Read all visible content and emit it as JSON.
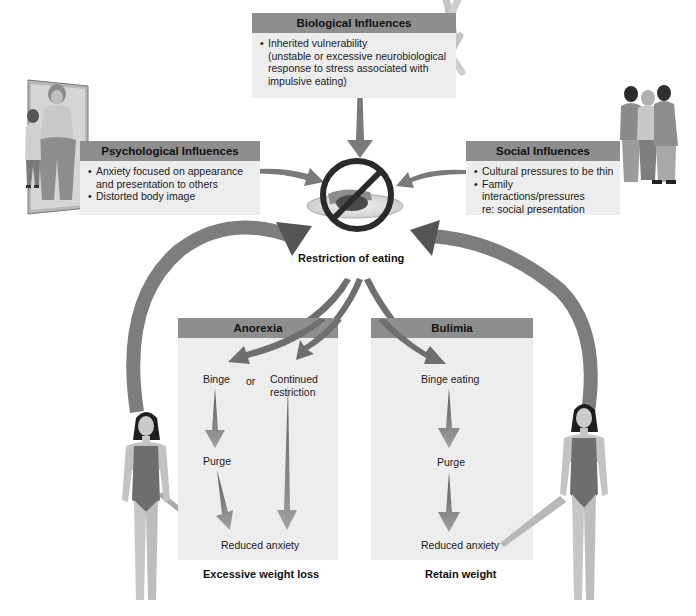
{
  "biological": {
    "title": "Biological Influences",
    "items": [
      "Inherited vulnerability (unstable or excessive neurobiological response to stress associated with impulsive eating)"
    ],
    "item_lines": [
      "Inherited vulnerability",
      "(unstable or excessive neurobiological",
      "response to stress associated with",
      "impulsive eating)"
    ]
  },
  "psychological": {
    "title": "Psychological Influences",
    "items": [
      "Anxiety focused on appearance and presentation to others",
      "Distorted body image"
    ],
    "item_lines": [
      "Anxiety focused on appearance",
      "and presentation to others",
      "Distorted body image"
    ]
  },
  "social": {
    "title": "Social Influences",
    "items": [
      "Cultural pressures to be thin",
      "Family interactions/pressures re: social presentation"
    ],
    "item_lines": [
      "Cultural pressures to be thin",
      "Family interactions/pressures",
      "re: social presentation"
    ]
  },
  "center": {
    "label": "Restriction of eating",
    "icon": "no-food-icon"
  },
  "anorexia": {
    "title": "Anorexia",
    "binge": "Binge",
    "or": "or",
    "continued_line1": "Continued",
    "continued_line2": "restriction",
    "purge": "Purge",
    "reduced_anxiety": "Reduced anxiety",
    "outcome": "Excessive weight loss"
  },
  "bulimia": {
    "title": "Bulimia",
    "binge_eating": "Binge eating",
    "purge": "Purge",
    "reduced_anxiety": "Reduced anxiety",
    "outcome": "Retain weight"
  },
  "colors": {
    "header_gray": "#8e8e8e",
    "panel_bg": "#ededed",
    "arrow_gray": "#7a7a7a",
    "swimsuit": "#6e6e6e",
    "skin": "#c8c8c8",
    "hair": "#1e1e1e"
  },
  "illustrations": {
    "psych": "mirror-reflection-icon",
    "bio": "chromosome-icon",
    "social": "peer-group-icon",
    "figure_left": "woman-figure-icon",
    "figure_right": "woman-figure-icon"
  }
}
